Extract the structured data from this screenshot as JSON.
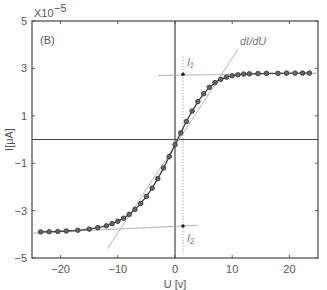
{
  "chart_data": {
    "type": "scatter",
    "panel_label": "(B)",
    "title": "",
    "xlabel": "U [v]",
    "ylabel": "I[μA]",
    "y_exponent_label": "X10",
    "y_exponent_power": "−5",
    "xlim": [
      -25,
      25
    ],
    "ylim": [
      -5,
      5
    ],
    "xticks": [
      -20,
      -10,
      0,
      10,
      20
    ],
    "xtick_labels": [
      "−20",
      "−10",
      "0",
      "10",
      "20"
    ],
    "yticks": [
      5,
      3,
      1,
      -1,
      -3,
      -5
    ],
    "ytick_labels": [
      "5",
      "3",
      "1",
      "−1",
      "−3",
      "−5"
    ],
    "grid": false,
    "series": [
      {
        "name": "I-V curve (markers + line)",
        "x": [
          -23.5,
          -22,
          -20.5,
          -19,
          -17,
          -15,
          -13.5,
          -12,
          -11,
          -10,
          -9,
          -8,
          -7,
          -6,
          -5,
          -4,
          -3,
          -2,
          -1,
          0,
          1,
          2,
          3,
          4,
          5,
          6,
          7,
          8,
          9,
          10,
          11,
          12,
          13,
          14.5,
          16,
          18,
          19.5,
          21,
          22.3,
          23.5
        ],
        "y": [
          -3.9,
          -3.89,
          -3.88,
          -3.86,
          -3.83,
          -3.78,
          -3.72,
          -3.64,
          -3.55,
          -3.45,
          -3.32,
          -3.16,
          -2.95,
          -2.7,
          -2.4,
          -2.05,
          -1.65,
          -1.2,
          -0.72,
          -0.22,
          0.28,
          0.76,
          1.2,
          1.6,
          1.93,
          2.2,
          2.4,
          2.54,
          2.63,
          2.69,
          2.73,
          2.76,
          2.77,
          2.78,
          2.79,
          2.79,
          2.8,
          2.8,
          2.8,
          2.8
        ]
      }
    ],
    "annotations": [
      {
        "label": "I₁",
        "x": 1.4,
        "y": 2.75,
        "note": "upper saturation tangent intersection"
      },
      {
        "label": "I₂",
        "x": 1.4,
        "y": -3.65,
        "note": "lower saturation tangent intersection"
      },
      {
        "label": "dI/dU",
        "note": "tangent at steepest slope"
      }
    ],
    "reference_lines": [
      {
        "type": "vertical",
        "x": 0,
        "style": "solid"
      },
      {
        "type": "horizontal",
        "y": 0,
        "style": "solid"
      },
      {
        "type": "vertical",
        "x": 1.4,
        "style": "dotted"
      },
      {
        "type": "line",
        "name": "upper tangent",
        "from": [
          -3,
          2.7
        ],
        "to": [
          25,
          2.8
        ]
      },
      {
        "type": "line",
        "name": "lower tangent",
        "from": [
          -25,
          -3.95
        ],
        "to": [
          4,
          -3.62
        ]
      },
      {
        "type": "line",
        "name": "dI/dU tangent",
        "from": [
          -11.8,
          -4.6
        ],
        "to": [
          11,
          3.8
        ]
      }
    ]
  }
}
